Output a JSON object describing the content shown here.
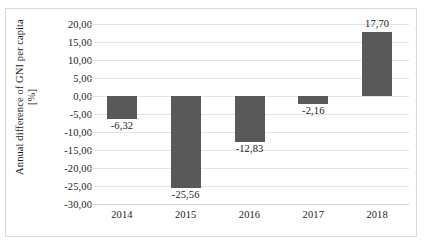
{
  "chart_data": {
    "type": "bar",
    "title": "",
    "xlabel": "",
    "ylabel": "Annual difference of GNI per capita [%]",
    "ylabel_line1": "Annual difference of GNI per capita",
    "ylabel_line2": "[%]",
    "categories": [
      "2014",
      "2015",
      "2016",
      "2017",
      "2018"
    ],
    "values": [
      -6.32,
      -25.56,
      -12.83,
      -2.16,
      17.7
    ],
    "value_labels": [
      "-6,32",
      "-25,56",
      "-12,83",
      "-2,16",
      "17,70"
    ],
    "ylim": [
      -30.0,
      20.0
    ],
    "ytick_values": [
      20.0,
      15.0,
      10.0,
      5.0,
      0.0,
      -5.0,
      -10.0,
      -15.0,
      -20.0,
      -25.0,
      -30.0
    ],
    "ytick_labels": [
      "20,00",
      "15,00",
      "10,00",
      "5,00",
      "0,00",
      "-5,00",
      "-10,00",
      "-15,00",
      "-20,00",
      "-25,00",
      "-30,00"
    ],
    "grid": true,
    "legend": false,
    "legend_position": "none",
    "decimal_separator": ",",
    "bar_color": "#595959",
    "gridline_color": "#e3e3e3",
    "border_color": "#d9d9d9",
    "text_color": "#1b1b1b"
  }
}
